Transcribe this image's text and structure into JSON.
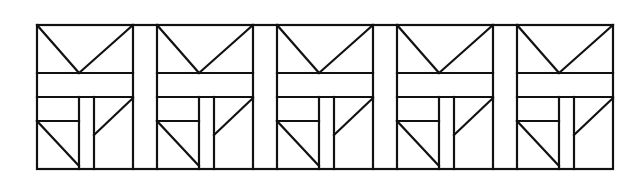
{
  "figure": {
    "title": "",
    "stroke_color": "#111111",
    "background": "#ffffff",
    "frame": {
      "x": 37,
      "y": 25,
      "width": 576,
      "height": 144
    },
    "panel_width": 96,
    "strip_width": 24,
    "panel_count": 5,
    "panel_origins_x": [
      37,
      157,
      277,
      397,
      517
    ],
    "panel_template": {
      "description": "Square tile: V-shape from top corners meeting at band top; horizontal band; lower area split by two verticals; lower-left has small horizontal with diagonal; lower-right has diagonal from top-right corner down to inner vertical.",
      "lines": [
        {
          "name": "v-left-arm",
          "x1": 0,
          "y1": 0,
          "x2": 42,
          "y2": 48
        },
        {
          "name": "v-right-arm",
          "x1": 96,
          "y1": 0,
          "x2": 42,
          "y2": 48
        },
        {
          "name": "band-top",
          "x1": 0,
          "y1": 48,
          "x2": 96,
          "y2": 48
        },
        {
          "name": "band-bottom",
          "x1": 0,
          "y1": 72,
          "x2": 96,
          "y2": 72
        },
        {
          "name": "inner-vertical-left",
          "x1": 42,
          "y1": 72,
          "x2": 42,
          "y2": 144
        },
        {
          "name": "inner-vertical-right",
          "x1": 57,
          "y1": 72,
          "x2": 57,
          "y2": 144
        },
        {
          "name": "lower-left-shelf",
          "x1": 0,
          "y1": 96,
          "x2": 42,
          "y2": 96
        },
        {
          "name": "lower-left-diagonal",
          "x1": 0,
          "y1": 96,
          "x2": 42,
          "y2": 141
        },
        {
          "name": "lower-right-diagonal",
          "x1": 96,
          "y1": 73,
          "x2": 57,
          "y2": 110
        }
      ]
    },
    "separator_strips": [
      {
        "x1": 133,
        "x2": 157
      },
      {
        "x1": 253,
        "x2": 277
      },
      {
        "x1": 373,
        "x2": 397
      },
      {
        "x1": 493,
        "x2": 517
      }
    ]
  }
}
